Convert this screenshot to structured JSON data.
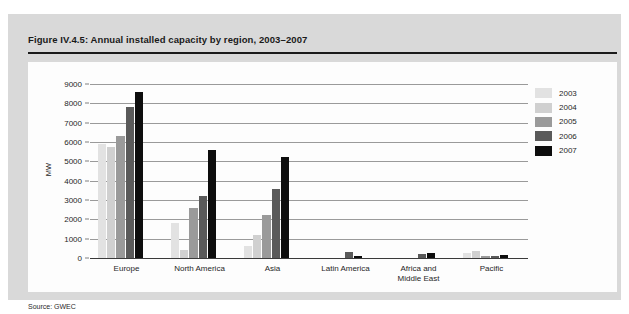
{
  "figure": {
    "title": "Figure IV.4.5: Annual installed capacity by region, 2003–2007",
    "source": "Source: GWEC",
    "panel_color": "#d9d9d9",
    "plot_background": "#fdfdfd"
  },
  "chart_data": {
    "type": "bar",
    "title": "Figure IV.4.5: Annual installed capacity by region, 2003–2007",
    "xlabel": "",
    "ylabel": "MW",
    "ylim": [
      0,
      9000
    ],
    "ytick_values": [
      0,
      1000,
      2000,
      3000,
      4000,
      5000,
      6000,
      7000,
      8000,
      9000
    ],
    "ytick_labels": [
      "0",
      "1000",
      "2000",
      "3000",
      "4000",
      "5000",
      "6000",
      "7000",
      "8000",
      "9000"
    ],
    "grid": true,
    "legend_position": "right",
    "categories": [
      "Europe",
      "North America",
      "Asia",
      "Latin America",
      "Africa and\nMiddle East",
      "Pacific"
    ],
    "category_labels": [
      [
        "Europe"
      ],
      [
        "North America"
      ],
      [
        "Asia"
      ],
      [
        "Latin America"
      ],
      [
        "Africa and",
        "Middle East"
      ],
      [
        "Pacific"
      ]
    ],
    "series": [
      {
        "name": "2003",
        "color": "#e2e2e2",
        "values": [
          5900,
          1800,
          600,
          0,
          0,
          250
        ]
      },
      {
        "name": "2004",
        "color": "#d0d0d0",
        "values": [
          5750,
          400,
          1200,
          0,
          0,
          350
        ]
      },
      {
        "name": "2005",
        "color": "#9a9a9a",
        "values": [
          6300,
          2600,
          2200,
          0,
          0,
          120
        ]
      },
      {
        "name": "2006",
        "color": "#5a5a5a",
        "values": [
          7800,
          3200,
          3550,
          320,
          190,
          110
        ]
      },
      {
        "name": "2007",
        "color": "#0d0d0d",
        "values": [
          8600,
          5600,
          5200,
          110,
          260,
          180
        ]
      }
    ]
  },
  "legend": {
    "entries": [
      {
        "label": "2003",
        "color": "#e2e2e2"
      },
      {
        "label": "2004",
        "color": "#d0d0d0"
      },
      {
        "label": "2005",
        "color": "#9a9a9a"
      },
      {
        "label": "2006",
        "color": "#5a5a5a"
      },
      {
        "label": "2007",
        "color": "#0d0d0d"
      }
    ]
  }
}
